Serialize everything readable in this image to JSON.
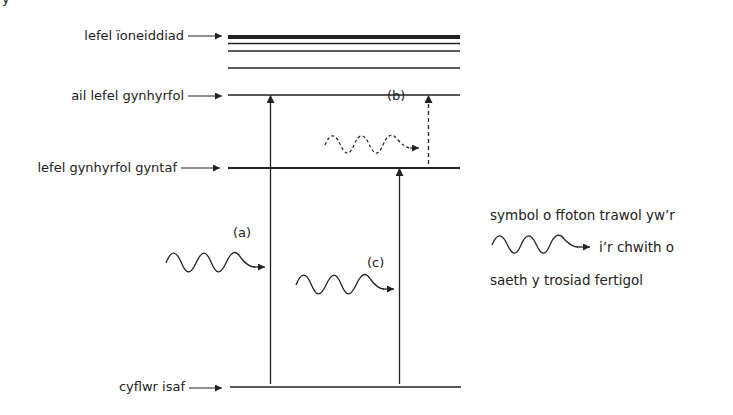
{
  "diagram": {
    "corner_glyph": "y",
    "levels": [
      {
        "id": "ionisation",
        "label": "lefel ïoneiddiad",
        "y": 37
      },
      {
        "id": "second-excited",
        "label": "ail lefel gynhyrfol",
        "y": 95
      },
      {
        "id": "first-excited",
        "label": "lefel gynhyrfol gyntaf",
        "y": 168
      },
      {
        "id": "ground",
        "label": "cyflwr isaf",
        "y": 387
      }
    ],
    "transitions": [
      {
        "label": "(a)",
        "from": "ground",
        "to": "second-excited",
        "style": "solid"
      },
      {
        "label": "(b)",
        "from": "first-excited",
        "to": "second-excited",
        "style": "dashed"
      },
      {
        "label": "(c)",
        "from": "ground",
        "to": "first-excited",
        "style": "solid"
      }
    ],
    "legend": {
      "line1": "symbol o ffoton trawol yw’r",
      "line2": "i’r chwith o",
      "line3": "saeth y trosiad fertigol",
      "icon": "wavy-arrow-icon"
    }
  }
}
